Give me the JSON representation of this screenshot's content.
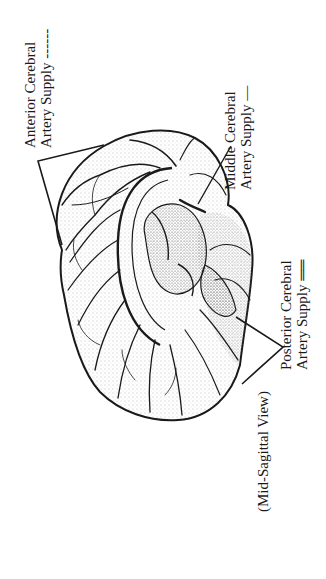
{
  "figure": {
    "view_label": "(Mid-Sagittal View)",
    "labels": {
      "anterior": {
        "line1": "Anterior Cerebral",
        "line2": "Artery Supply",
        "legend_style": "dashed",
        "legend_glyph": "------"
      },
      "middle": {
        "line1": "Middle Cerebral",
        "line2": "Artery Supply",
        "legend_style": "solid",
        "legend_glyph": "—"
      },
      "posterior": {
        "line1": "Posterior Cerebral",
        "line2": "Artery Supply",
        "legend_style": "double",
        "legend_glyph": "══"
      }
    },
    "colors": {
      "ink": "#1a1a1a",
      "background": "#ffffff",
      "stipple": "#555555"
    }
  }
}
